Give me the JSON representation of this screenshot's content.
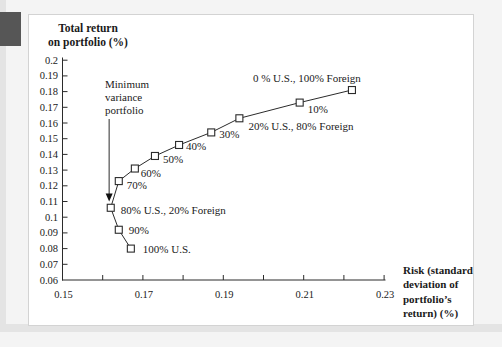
{
  "page": {
    "accent_tab_color": "#565656"
  },
  "chart_data": {
    "type": "line",
    "title_lines": [
      "Total return",
      "on portfolio (%)"
    ],
    "xlabel_lines": [
      "Risk (standard",
      "deviation of",
      "portfolio’s",
      "return) (%)"
    ],
    "x_axis": {
      "min": 0.15,
      "max": 0.23,
      "tick_step": 0.01,
      "labeled_ticks": [
        "0.15",
        "0.17",
        "0.19",
        "0.21",
        "0.23"
      ],
      "labeled_tick_values": [
        0.15,
        0.17,
        0.19,
        0.21,
        0.23
      ]
    },
    "y_axis": {
      "min": 0.06,
      "max": 0.2,
      "tick_step": 0.01,
      "tick_labels": [
        "0.2",
        "0.19",
        "0.18",
        "0.17",
        "0.16",
        "0.15",
        "0.14",
        "0.13",
        "0.12",
        "0.11",
        "0.1",
        "0.09",
        "0.08",
        "0.07",
        "0.06"
      ]
    },
    "points": [
      {
        "label": "0 % U.S., 100% Foreign",
        "risk": 0.222,
        "return": 0.181,
        "label_dx": -99,
        "label_dy": -8
      },
      {
        "label": "10%",
        "risk": 0.209,
        "return": 0.173,
        "label_dx": 8,
        "label_dy": 10
      },
      {
        "label": "20% U.S., 80% Foreign",
        "risk": 0.194,
        "return": 0.163,
        "label_dx": 9,
        "label_dy": 12
      },
      {
        "label": "30%",
        "risk": 0.187,
        "return": 0.154,
        "label_dx": 8,
        "label_dy": 6
      },
      {
        "label": "40%",
        "risk": 0.179,
        "return": 0.146,
        "label_dx": 7,
        "label_dy": 5
      },
      {
        "label": "50%",
        "risk": 0.173,
        "return": 0.139,
        "label_dx": 8,
        "label_dy": 7
      },
      {
        "label": "60%",
        "risk": 0.168,
        "return": 0.131,
        "label_dx": 6,
        "label_dy": 8
      },
      {
        "label": "70%",
        "risk": 0.164,
        "return": 0.123,
        "label_dx": 8,
        "label_dy": 8
      },
      {
        "label": "80% U.S., 20% Foreign",
        "risk": 0.162,
        "return": 0.106,
        "label_dx": 10,
        "label_dy": 6
      },
      {
        "label": "90%",
        "risk": 0.164,
        "return": 0.092,
        "label_dx": 10,
        "label_dy": 4
      },
      {
        "label": "100% U.S.",
        "risk": 0.167,
        "return": 0.08,
        "label_dx": 12,
        "label_dy": 4
      }
    ],
    "annotation": {
      "text_lines": [
        "Minimum",
        "variance",
        "portfolio"
      ],
      "arrow_tip": {
        "risk": 0.1616,
        "return": 0.11
      }
    }
  }
}
